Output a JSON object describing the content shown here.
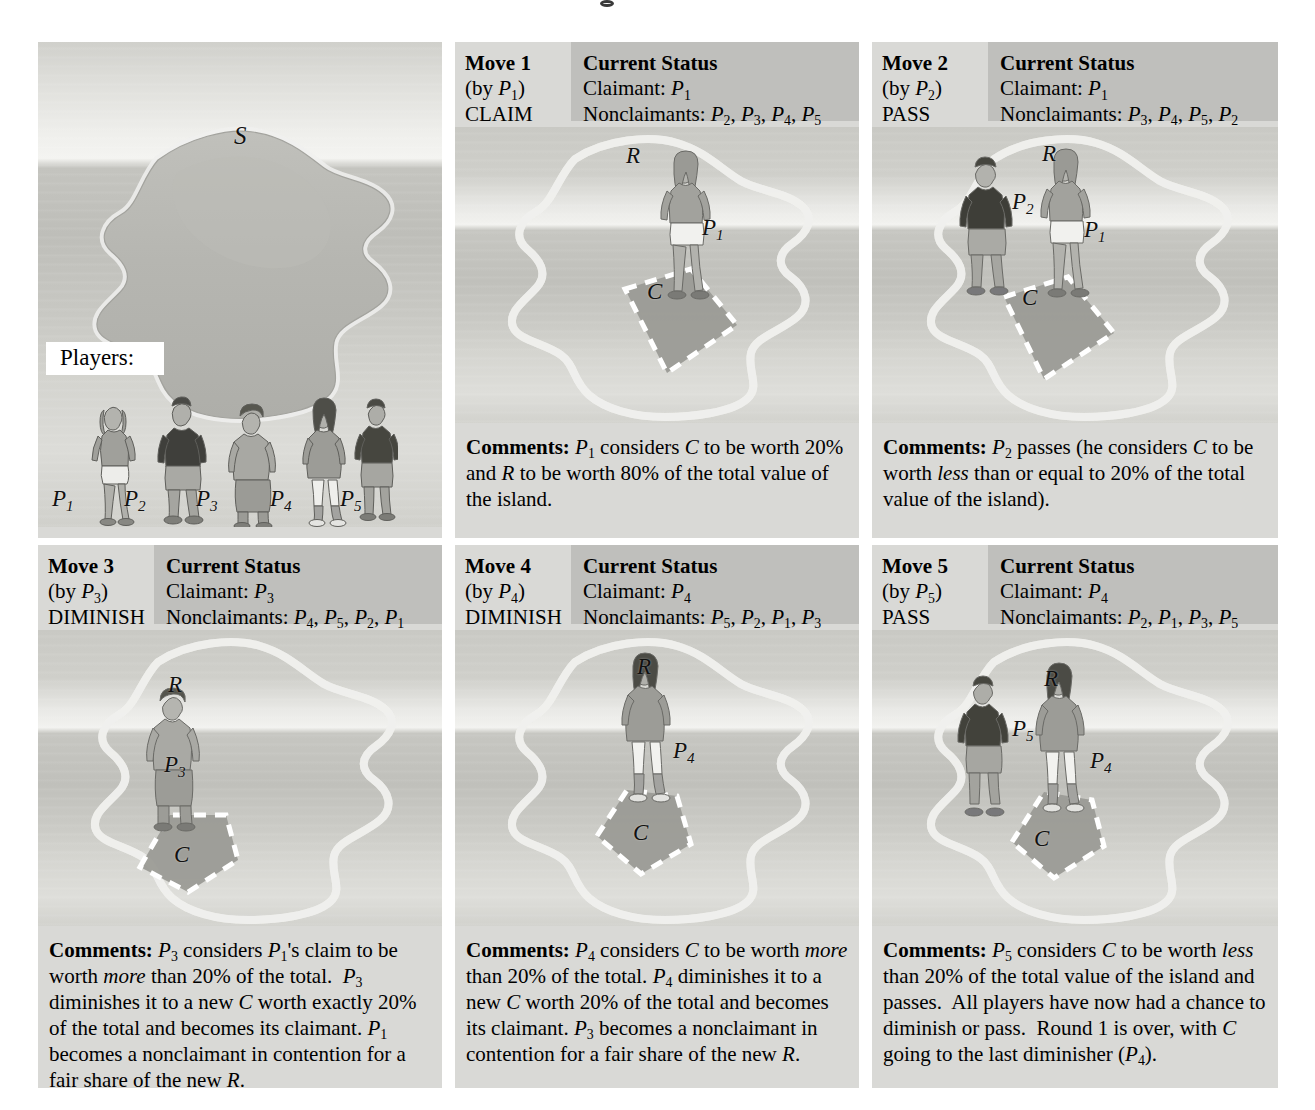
{
  "figure": {
    "domain": "diagram",
    "overview_panel": {
      "island_label": "S",
      "players_tag": "Players:",
      "player_labels": [
        "P1",
        "P2",
        "P3",
        "P4",
        "P5"
      ]
    }
  },
  "panels": [
    {
      "id": "move-1",
      "move_label": "Move 1",
      "by_label": "(by P1)",
      "action": "CLAIM",
      "status_title": "Current Status",
      "claimant_line": "Claimant: P1",
      "nonclaimants_line": "Nonclaimants: P2, P3, P4, P5",
      "claimant_value": "P1",
      "nonclaimants": [
        "P2",
        "P3",
        "P4",
        "P5"
      ],
      "scene_labels": [
        "R",
        "C",
        "P1"
      ],
      "figures_on_island": [
        "P1"
      ],
      "comments_head": "Comments:",
      "comments_body": "P1 considers C to be worth 20% and R to be worth 80% of the total value of the island."
    },
    {
      "id": "move-2",
      "move_label": "Move 2",
      "by_label": "(by P2)",
      "action": "PASS",
      "status_title": "Current Status",
      "claimant_line": "Claimant: P1",
      "nonclaimants_line": "Nonclaimants: P3, P4, P5, P2",
      "claimant_value": "P1",
      "nonclaimants": [
        "P3",
        "P4",
        "P5",
        "P2"
      ],
      "scene_labels": [
        "R",
        "C",
        "P1",
        "P2"
      ],
      "figures_on_island": [
        "P2",
        "P1"
      ],
      "comments_head": "Comments:",
      "comments_body": "P2 passes (he considers C to be worth less than or equal to 20% of the total value of the island)."
    },
    {
      "id": "move-3",
      "move_label": "Move 3",
      "by_label": "(by P3)",
      "action": "DIMINISH",
      "status_title": "Current Status",
      "claimant_line": "Claimant: P3",
      "nonclaimants_line": "Nonclaimants: P4, P5, P2, P1",
      "claimant_value": "P3",
      "nonclaimants": [
        "P4",
        "P5",
        "P2",
        "P1"
      ],
      "scene_labels": [
        "R",
        "C",
        "P3"
      ],
      "figures_on_island": [
        "P3"
      ],
      "comments_head": "Comments:",
      "comments_body": "P3 considers P1's claim to be worth more than 20% of the total. P3 diminishes it to a new C worth exactly 20% of the total and becomes its claimant. P1 becomes a nonclaimant in contention for a fair share of the new R."
    },
    {
      "id": "move-4",
      "move_label": "Move 4",
      "by_label": "(by P4)",
      "action": "DIMINISH",
      "status_title": "Current Status",
      "claimant_line": "Claimant: P4",
      "nonclaimants_line": "Nonclaimants: P5, P2, P1, P3",
      "claimant_value": "P4",
      "nonclaimants": [
        "P5",
        "P2",
        "P1",
        "P3"
      ],
      "scene_labels": [
        "R",
        "C",
        "P4"
      ],
      "figures_on_island": [
        "P4"
      ],
      "comments_head": "Comments:",
      "comments_body": "P4 considers C to be worth more than 20% of the total. P4 diminishes it to a new C worth 20% of the total and becomes its claimant. P3 becomes a nonclaimant in contention for a fair share of the new R."
    },
    {
      "id": "move-5",
      "move_label": "Move 5",
      "by_label": "(by P5)",
      "action": "PASS",
      "status_title": "Current Status",
      "claimant_line": "Claimant: P4",
      "nonclaimants_line": "Nonclaimants: P2, P1, P3, P5",
      "claimant_value": "P4",
      "nonclaimants": [
        "P2",
        "P1",
        "P3",
        "P5"
      ],
      "scene_labels": [
        "R",
        "C",
        "P4",
        "P5"
      ],
      "figures_on_island": [
        "P5",
        "P4"
      ],
      "comments_head": "Comments:",
      "comments_body": "P5 considers C to be worth less than 20% of the total value of the island and passes. All players have now had a chance to diminish or pass. Round 1 is over, with C going to the last diminisher (P4)."
    }
  ],
  "colors": {
    "panel_background": "#d9d9d6",
    "status_box": "#bfbfbc",
    "page_background": "#ffffff",
    "island_fill": "#b9b9b4",
    "claim_fill": "#a8a8a3",
    "text": "#000000"
  }
}
